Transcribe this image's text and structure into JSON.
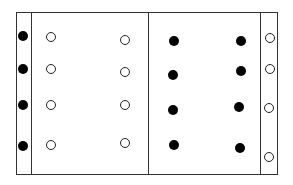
{
  "diagram": {
    "colors": {
      "line": "#333333",
      "filled": "#000000",
      "hollow_stroke": "#222222",
      "background": "#ffffff"
    },
    "frame": {
      "x": 16,
      "y": 12,
      "w": 262,
      "h": 163
    },
    "dividers": [
      31,
      148,
      260
    ],
    "dots": [
      {
        "x": 23,
        "y": 36,
        "type": "filled"
      },
      {
        "x": 23,
        "y": 69,
        "type": "filled"
      },
      {
        "x": 23,
        "y": 105,
        "type": "filled"
      },
      {
        "x": 23,
        "y": 146,
        "type": "filled"
      },
      {
        "x": 51,
        "y": 37,
        "type": "hollow"
      },
      {
        "x": 51,
        "y": 69,
        "type": "hollow"
      },
      {
        "x": 51,
        "y": 105,
        "type": "hollow"
      },
      {
        "x": 51,
        "y": 145,
        "type": "hollow"
      },
      {
        "x": 125,
        "y": 40,
        "type": "hollow"
      },
      {
        "x": 125,
        "y": 72,
        "type": "hollow"
      },
      {
        "x": 125,
        "y": 105,
        "type": "hollow"
      },
      {
        "x": 125,
        "y": 143,
        "type": "hollow"
      },
      {
        "x": 174,
        "y": 41,
        "type": "filled"
      },
      {
        "x": 173,
        "y": 75,
        "type": "filled"
      },
      {
        "x": 173,
        "y": 110,
        "type": "filled"
      },
      {
        "x": 174,
        "y": 145,
        "type": "filled"
      },
      {
        "x": 241,
        "y": 41,
        "type": "filled"
      },
      {
        "x": 241,
        "y": 71,
        "type": "filled"
      },
      {
        "x": 239,
        "y": 107,
        "type": "filled"
      },
      {
        "x": 240,
        "y": 148,
        "type": "filled"
      },
      {
        "x": 270,
        "y": 38,
        "type": "hollow"
      },
      {
        "x": 270,
        "y": 69,
        "type": "hollow"
      },
      {
        "x": 269,
        "y": 108,
        "type": "hollow"
      },
      {
        "x": 269,
        "y": 157,
        "type": "hollow"
      }
    ]
  }
}
